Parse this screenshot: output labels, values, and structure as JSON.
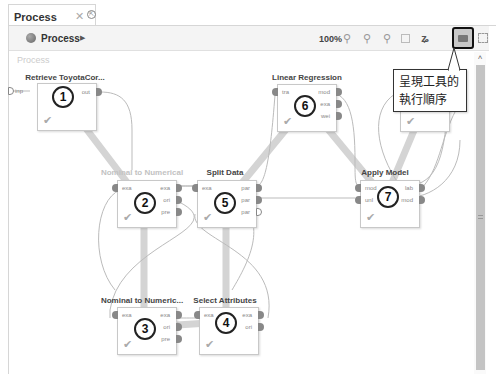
{
  "tab": {
    "title": "Process",
    "close_icon": "close-icon",
    "undock_icon": "undock-icon"
  },
  "toolbar": {
    "breadcrumb_label": "Process",
    "breadcrumb_arrow": "▶",
    "zoom_level": "100%",
    "icons": [
      "zoom-in-icon",
      "zoom-out-icon",
      "zoom-fit-icon",
      "auto-arrange-icon",
      "auto-wire-icon",
      "show-execution-order-icon",
      "fullscreen-icon"
    ]
  },
  "canvas": {
    "title": "Process",
    "input_port": "inp"
  },
  "operators": [
    {
      "id": 1,
      "name": "Retrieve ToyotaCor...",
      "order": "1",
      "in_ports": [],
      "out_ports": [
        "out"
      ]
    },
    {
      "id": 2,
      "name": "Nominal to Numerical",
      "order": "2",
      "in_ports": [
        "exa"
      ],
      "out_ports": [
        "exa",
        "ori",
        "pre"
      ]
    },
    {
      "id": 3,
      "name": "Nominal to Numeric...",
      "order": "3",
      "in_ports": [
        "exa"
      ],
      "out_ports": [
        "exa",
        "ori",
        "pre"
      ]
    },
    {
      "id": 4,
      "name": "Select Attributes",
      "order": "4",
      "in_ports": [
        "exa"
      ],
      "out_ports": [
        "exa",
        "ori"
      ]
    },
    {
      "id": 5,
      "name": "Split Data",
      "order": "5",
      "in_ports": [
        "exa"
      ],
      "out_ports": [
        "par",
        "par",
        "par"
      ]
    },
    {
      "id": 6,
      "name": "Linear Regression",
      "order": "6",
      "in_ports": [
        "tra"
      ],
      "out_ports": [
        "mod",
        "exa",
        "wei"
      ]
    },
    {
      "id": 7,
      "name": "Apply Model",
      "order": "7",
      "in_ports": [
        "mod",
        "unl"
      ],
      "out_ports": [
        "lab",
        "mod"
      ]
    },
    {
      "id": 8,
      "name": "Per...",
      "in_ports": [
        "lab",
        "per"
      ],
      "out_ports": []
    }
  ],
  "tooltip": {
    "line1": "呈現工具的",
    "line2": "執行順序"
  },
  "scrollbar": {
    "up_arrow": "˄"
  }
}
